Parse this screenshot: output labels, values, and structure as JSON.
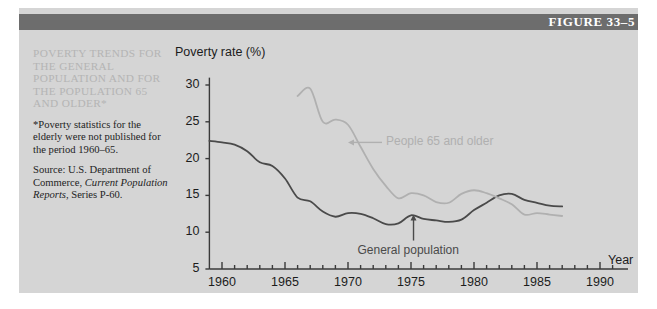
{
  "figure": {
    "number_label": "FIGURE 33–5",
    "caption_title": "POVERTY TRENDS FOR THE GENERAL POPULATION AND FOR THE POPULATION 65 AND OLDER*",
    "footnote": "*Poverty statistics for the elderly were not published for the period 1960–65.",
    "source_prefix": "Source: U.S. Department of Commerce, ",
    "source_italic": "Current Population Reports",
    "source_suffix": ", Series P-60."
  },
  "colors": {
    "panel_background": "#d5d5d5",
    "header_bar": "#6d6d6d",
    "header_text": "#ffffff",
    "caption_title": "#b4b4b4",
    "body_text": "#232323",
    "axis": "#3a3a3a",
    "general_population_line": "#4a4a4a",
    "elderly_line": "#b0b0b0"
  },
  "chart_data": {
    "type": "line",
    "title": "",
    "xlabel": "Year",
    "ylabel": "Poverty rate (%)",
    "xlim": [
      1958.5,
      1991.5
    ],
    "ylim": [
      5,
      31
    ],
    "yticks": [
      5,
      10,
      15,
      20,
      25,
      30
    ],
    "xticks_major": [
      1960,
      1965,
      1970,
      1975,
      1980,
      1985,
      1990
    ],
    "xtick_minor_step": 1,
    "grid": false,
    "legend_position": "inline-annotations",
    "annotations": [
      {
        "name": "elderly-label",
        "text": "People 65 and older",
        "x": 1972.5,
        "y": 23.0,
        "arrow_to": {
          "x": 1970.0,
          "y": 22.2
        }
      },
      {
        "name": "general-label",
        "text": "General population",
        "x": 1975.0,
        "y": 7.6,
        "arrow_to": {
          "x": 1975.2,
          "y": 12.4
        }
      }
    ],
    "series": [
      {
        "name": "General population",
        "color": "#4a4a4a",
        "x": [
          1959,
          1960,
          1961,
          1962,
          1963,
          1964,
          1965,
          1966,
          1967,
          1968,
          1969,
          1970,
          1971,
          1972,
          1973,
          1974,
          1975,
          1976,
          1977,
          1978,
          1979,
          1980,
          1981,
          1982,
          1983,
          1984,
          1985,
          1986,
          1987
        ],
        "values": [
          22.4,
          22.2,
          21.9,
          21.0,
          19.5,
          19.0,
          17.3,
          14.7,
          14.2,
          12.8,
          12.1,
          12.6,
          12.5,
          11.9,
          11.1,
          11.2,
          12.3,
          11.8,
          11.6,
          11.4,
          11.7,
          13.0,
          14.0,
          15.0,
          15.2,
          14.4,
          14.0,
          13.6,
          13.5
        ]
      },
      {
        "name": "People 65 and older",
        "color": "#b0b0b0",
        "x": [
          1966,
          1967,
          1968,
          1969,
          1970,
          1971,
          1972,
          1973,
          1974,
          1975,
          1976,
          1977,
          1978,
          1979,
          1980,
          1981,
          1982,
          1983,
          1984,
          1985,
          1986,
          1987
        ],
        "values": [
          28.5,
          29.5,
          25.0,
          25.3,
          24.6,
          21.6,
          18.6,
          16.3,
          14.6,
          15.3,
          15.0,
          14.1,
          14.0,
          15.2,
          15.7,
          15.3,
          14.6,
          13.8,
          12.4,
          12.6,
          12.4,
          12.2
        ]
      }
    ]
  }
}
